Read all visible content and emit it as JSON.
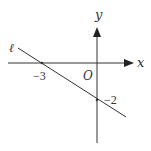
{
  "diagram": {
    "type": "coordinate-plane-line",
    "axes": {
      "x_label": "x",
      "y_label": "y",
      "origin_label": "O"
    },
    "line": {
      "label": "ℓ",
      "x_intercept": -3,
      "y_intercept": -2
    },
    "tick_labels": {
      "x_intercept_label": "−3",
      "y_intercept_label": "−2"
    },
    "colors": {
      "stroke": "#333333",
      "background": "#ffffff"
    }
  }
}
